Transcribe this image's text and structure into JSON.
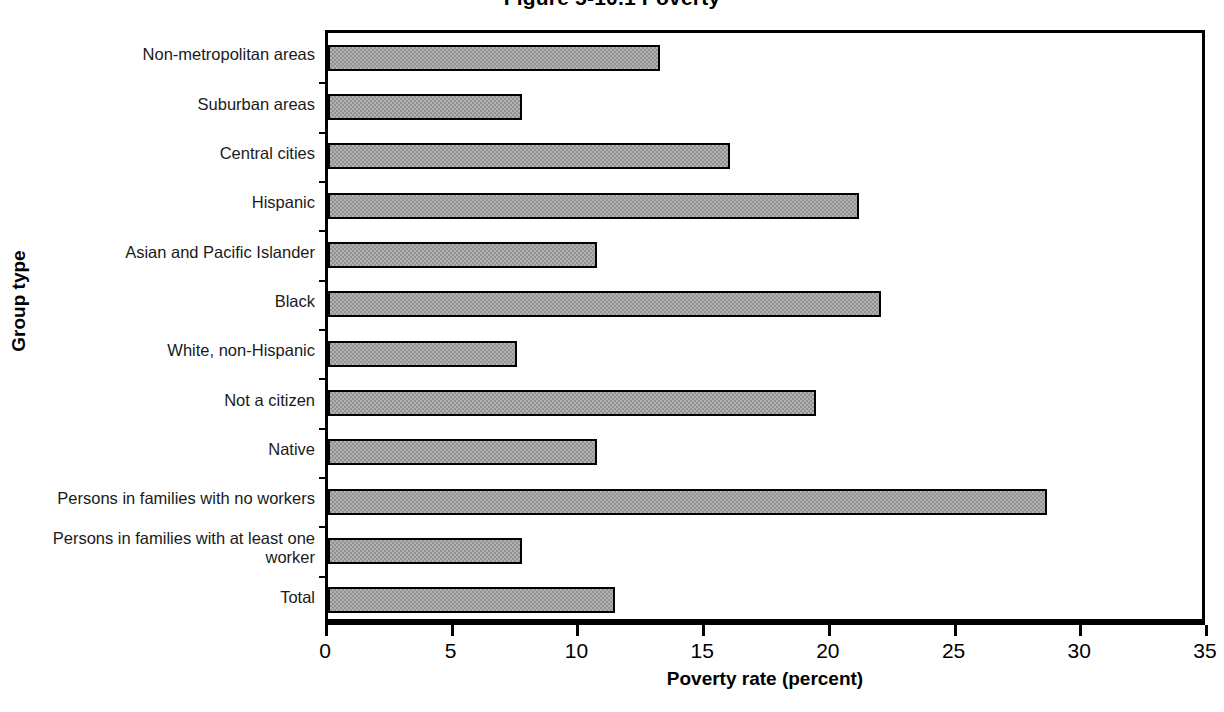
{
  "chart_data": {
    "type": "bar",
    "orientation": "horizontal",
    "title": "Figure 5-10.1 Poverty",
    "xlabel": "Poverty rate (percent)",
    "ylabel": "Group type",
    "xlim": [
      0,
      35
    ],
    "xticks": [
      0,
      5,
      10,
      15,
      20,
      25,
      30,
      35
    ],
    "xtick_labels": [
      "0",
      "5",
      "10",
      "15",
      "20",
      "25",
      "30",
      "35"
    ],
    "grid": false,
    "legend": "none",
    "bar_fill_color": "#919191",
    "bar_edge_color": "#000000",
    "categories": [
      "Non-metropolitan areas",
      "Suburban areas",
      "Central cities",
      "Hispanic",
      "Asian and Pacific Islander",
      "Black",
      "White, non-Hispanic",
      "Not a citizen",
      "Native",
      "Persons in families with no workers",
      "Persons in families with at least one worker",
      "Total"
    ],
    "values": [
      13.2,
      7.7,
      16.0,
      21.1,
      10.7,
      22.0,
      7.5,
      19.4,
      10.7,
      28.6,
      7.7,
      11.4
    ]
  }
}
